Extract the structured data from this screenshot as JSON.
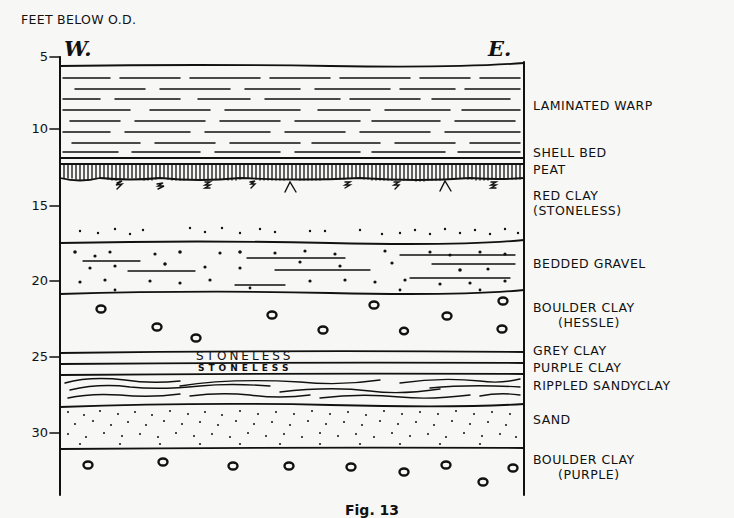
{
  "axis": {
    "title": "FEET BELOW O.D.",
    "ticks": [
      {
        "label": "5",
        "y": 57
      },
      {
        "label": "10",
        "y": 129
      },
      {
        "label": "15",
        "y": 206
      },
      {
        "label": "20",
        "y": 281
      },
      {
        "label": "25",
        "y": 357
      },
      {
        "label": "30",
        "y": 433
      }
    ]
  },
  "directions": {
    "west": "W.",
    "east": "E."
  },
  "layers": [
    {
      "name": "laminated-warp",
      "label": "LAMINATED WARP",
      "pattern": "dashed-lines"
    },
    {
      "name": "shell-bed",
      "label": "SHELL BED",
      "pattern": "thin-band"
    },
    {
      "name": "peat",
      "label": "PEAT",
      "pattern": "vertical-hatch-roots"
    },
    {
      "name": "red-clay",
      "label": "RED CLAY",
      "sublabel": "(STONELESS)",
      "pattern": "blank-dotted-base"
    },
    {
      "name": "bedded-gravel",
      "label": "BEDDED GRAVEL",
      "pattern": "dots-and-lines"
    },
    {
      "name": "boulder-clay-hessle",
      "label": "BOULDER CLAY",
      "sublabel": "(HESSLE)",
      "pattern": "boulders"
    },
    {
      "name": "grey-clay",
      "label": "GREY CLAY",
      "inner_text": "STONELESS",
      "pattern": "band"
    },
    {
      "name": "purple-clay",
      "label": "PURPLE CLAY",
      "inner_text": "STONELESS",
      "pattern": "band"
    },
    {
      "name": "rippled-sandy-clay",
      "label": "RIPPLED SANDYCLAY",
      "pattern": "wavy-lines"
    },
    {
      "name": "sand",
      "label": "SAND",
      "pattern": "fine-dots"
    },
    {
      "name": "boulder-clay-purple",
      "label": "BOULDER CLAY",
      "sublabel": "(PURPLE)",
      "pattern": "boulders"
    }
  ],
  "caption": "Fig. 13"
}
